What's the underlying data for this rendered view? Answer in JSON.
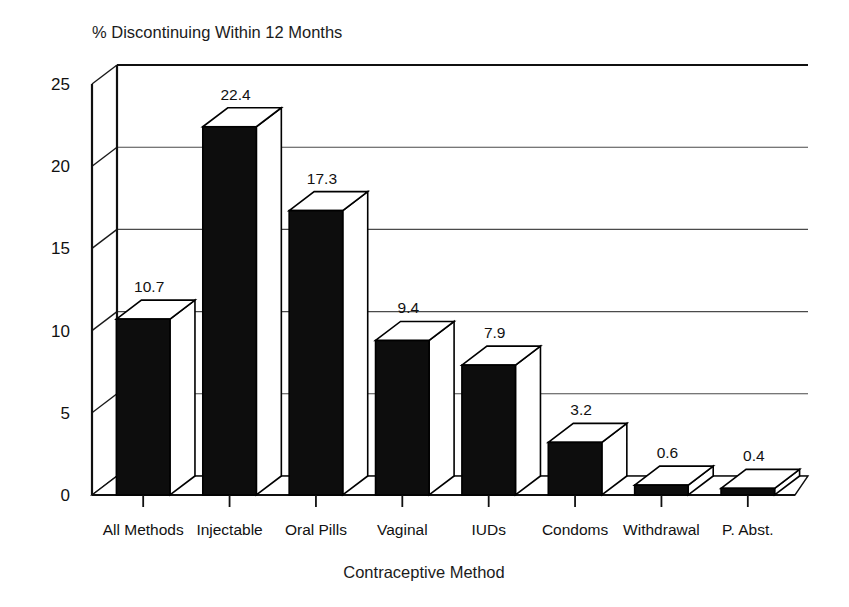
{
  "chart_data": {
    "type": "bar",
    "title": "% Discontinuing Within 12 Months",
    "xlabel": "Contraceptive Method",
    "ylabel": "",
    "categories": [
      "All Methods",
      "Injectable",
      "Oral Pills",
      "Vaginal",
      "IUDs",
      "Condoms",
      "Withdrawal",
      "P. Abst."
    ],
    "values": [
      10.7,
      22.4,
      17.3,
      9.4,
      7.9,
      3.2,
      0.6,
      0.4
    ],
    "value_labels": [
      "10.7",
      "22.4",
      "17.3",
      "9.4",
      "7.9",
      "3.2",
      "0.6",
      "0.4"
    ],
    "ylim": [
      0,
      25
    ],
    "ytick_labels": [
      "0",
      "5",
      "10",
      "15",
      "20",
      "25"
    ],
    "ytick_values": [
      0,
      5,
      10,
      15,
      20,
      25
    ],
    "grid": true,
    "grid_axis": "y",
    "legend": "none",
    "style": "3d-bar",
    "bar_color": "#0d0d0d",
    "bar_top_color": "#ffffff",
    "background_color": "#ffffff",
    "axis_color": "#101010",
    "grid_color": "#4a4a4a"
  }
}
